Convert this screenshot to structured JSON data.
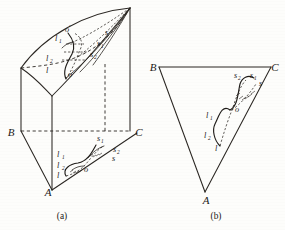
{
  "figure": {
    "captions": [
      {
        "id": "caption-a",
        "text": "(a)",
        "x": 62,
        "y": 219
      },
      {
        "id": "caption-b",
        "text": "(b)",
        "x": 216,
        "y": 219
      }
    ],
    "panel_a": {
      "name": "oblique-triangular-prism-with-curve",
      "vertices": [
        {
          "label": "B",
          "x": 11,
          "y": 136
        },
        {
          "label": "C",
          "x": 139,
          "y": 136
        },
        {
          "label": "A",
          "x": 48,
          "y": 196
        }
      ],
      "base_curve_labels": [
        {
          "label": "l",
          "sub": "1",
          "x": 57,
          "y": 157
        },
        {
          "label": "l",
          "sub": "2",
          "x": 57,
          "y": 168
        },
        {
          "label": "l",
          "sub": "",
          "x": 57,
          "y": 178
        },
        {
          "label": "o",
          "sub": "",
          "x": 84,
          "y": 172
        },
        {
          "label": "s",
          "sub": "1",
          "x": 97,
          "y": 141
        },
        {
          "label": "s",
          "sub": "2",
          "x": 113,
          "y": 152
        },
        {
          "label": "s",
          "sub": "",
          "x": 112,
          "y": 161
        }
      ],
      "top_curve_labels": [
        {
          "label": "o",
          "sub": "'",
          "x": 65,
          "y": 32
        },
        {
          "label": "l",
          "sub": "1",
          "x": 58,
          "y": 41
        },
        {
          "label": "l",
          "sub": "2",
          "x": 48,
          "y": 61
        },
        {
          "label": "l",
          "sub": "",
          "x": 47,
          "y": 72
        },
        {
          "label": "o",
          "sub": "'",
          "x": 69,
          "y": 76
        },
        {
          "label": "s",
          "sub": "",
          "x": 104,
          "y": 35
        },
        {
          "label": "s",
          "sub": "1",
          "x": 98,
          "y": 46
        },
        {
          "label": "s",
          "sub": "2",
          "x": 92,
          "y": 57
        }
      ]
    },
    "panel_b": {
      "name": "top-view-triangle-with-curve",
      "vertices": [
        {
          "label": "B",
          "x": 153,
          "y": 70
        },
        {
          "label": "C",
          "x": 273,
          "y": 70
        },
        {
          "label": "A",
          "x": 206,
          "y": 202
        }
      ],
      "curve_labels": [
        {
          "label": "s",
          "sub": "2",
          "x": 236,
          "y": 76
        },
        {
          "label": "s",
          "sub": "1",
          "x": 253,
          "y": 76
        },
        {
          "label": "s",
          "sub": "",
          "x": 259,
          "y": 84
        },
        {
          "label": "o",
          "sub": "",
          "x": 233,
          "y": 110
        },
        {
          "label": "l",
          "sub": "1",
          "x": 208,
          "y": 116
        },
        {
          "label": "l",
          "sub": "2",
          "x": 206,
          "y": 136
        },
        {
          "label": "l",
          "sub": "",
          "x": 215,
          "y": 149
        }
      ]
    }
  }
}
